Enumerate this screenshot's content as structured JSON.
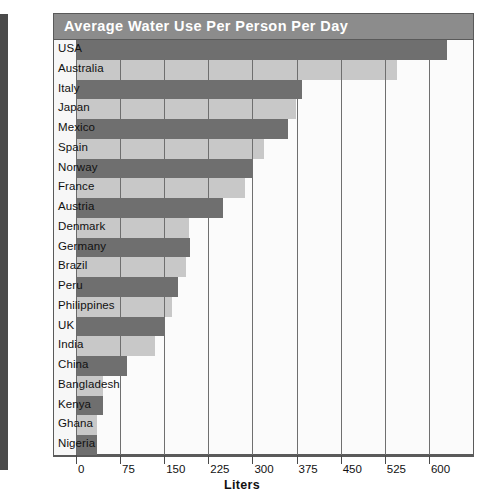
{
  "chart_data": {
    "type": "bar",
    "orientation": "horizontal",
    "title": "Average Water Use Per Person Per Day",
    "xlabel": "Liters",
    "ylabel": "",
    "xlim": [
      0,
      675
    ],
    "xticks": [
      0,
      75,
      150,
      225,
      300,
      375,
      450,
      525,
      600
    ],
    "grid": true,
    "legend": false,
    "categories": [
      "USA",
      "Australia",
      "Italy",
      "Japan",
      "Mexico",
      "Spain",
      "Norway",
      "France",
      "Austria",
      "Denmark",
      "Germany",
      "Brazil",
      "Peru",
      "Philippines",
      "UK",
      "India",
      "China",
      "Bangladesh",
      "Kenya",
      "Ghana",
      "Nigeria"
    ],
    "values": [
      630,
      545,
      385,
      374,
      360,
      320,
      301,
      287,
      250,
      192,
      193,
      187,
      173,
      164,
      149,
      135,
      86,
      46,
      46,
      36,
      36
    ],
    "bar_colors": [
      "dark",
      "light",
      "dark",
      "light",
      "dark",
      "light",
      "dark",
      "light",
      "dark",
      "light",
      "dark",
      "light",
      "dark",
      "light",
      "dark",
      "light",
      "dark",
      "light",
      "dark",
      "light",
      "dark"
    ],
    "colors": {
      "dark_bar": "#6f6f6f",
      "light_bar": "#c8c8c8",
      "title_bar": "#8c8c8c",
      "title_text": "#ffffff",
      "frame": "#5a5a5a",
      "plot_background": "#fbfbfb",
      "label_background": "#f7f7f7"
    }
  },
  "axis": {
    "tick_labels": [
      "0",
      "75",
      "150",
      "225",
      "300",
      "375",
      "450",
      "525",
      "600"
    ],
    "x_axis_title": "Liters"
  },
  "header": {
    "title": "Average Water Use Per Person Per Day"
  }
}
